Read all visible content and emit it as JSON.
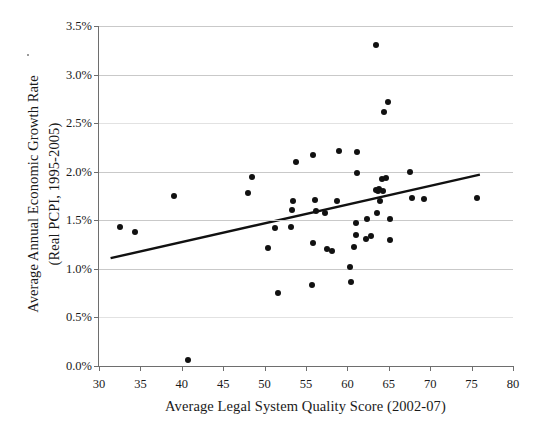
{
  "figure": {
    "top_artifact_text": "——   ·",
    "stray_mark": "·"
  },
  "chart_data": {
    "type": "scatter",
    "title": "",
    "xlabel": "Average Legal System Quality Score (2002-07)",
    "ylabel_line1": "Average Annual Economic Growth Rate",
    "ylabel_line2": "(Real PCPI, 1995-2005)",
    "xlim": [
      30,
      80
    ],
    "ylim": [
      0,
      3.5
    ],
    "xticks": [
      30,
      35,
      40,
      45,
      50,
      55,
      60,
      65,
      70,
      75,
      80
    ],
    "xtick_labels": [
      "30",
      "35",
      "40",
      "45",
      "50",
      "55",
      "60",
      "65",
      "70",
      "75",
      "80"
    ],
    "yticks": [
      0.0,
      0.5,
      1.0,
      1.5,
      2.0,
      2.5,
      3.0,
      3.5
    ],
    "ytick_labels": [
      "0.0%",
      "0.5%",
      "1.0%",
      "1.5%",
      "2.0%",
      "2.5%",
      "3.0%",
      "3.5%"
    ],
    "ytick_units": "percent",
    "grid": "horizontal",
    "legend": "none",
    "marker": "filled-circle",
    "marker_color": "#111111",
    "grid_color": "#c9c9c9",
    "axis_color": "#6e6e6e",
    "points": [
      {
        "x": 32.5,
        "y": 1.43
      },
      {
        "x": 34.3,
        "y": 1.38
      },
      {
        "x": 39.1,
        "y": 1.75
      },
      {
        "x": 40.8,
        "y": 0.06
      },
      {
        "x": 48.0,
        "y": 1.78
      },
      {
        "x": 48.5,
        "y": 1.95
      },
      {
        "x": 50.4,
        "y": 1.21
      },
      {
        "x": 51.3,
        "y": 1.42
      },
      {
        "x": 51.6,
        "y": 0.75
      },
      {
        "x": 53.2,
        "y": 1.43
      },
      {
        "x": 53.3,
        "y": 1.61
      },
      {
        "x": 53.4,
        "y": 1.7
      },
      {
        "x": 53.8,
        "y": 2.1
      },
      {
        "x": 55.7,
        "y": 0.83
      },
      {
        "x": 55.8,
        "y": 1.27
      },
      {
        "x": 55.9,
        "y": 2.17
      },
      {
        "x": 56.1,
        "y": 1.71
      },
      {
        "x": 56.2,
        "y": 1.6
      },
      {
        "x": 57.3,
        "y": 1.58
      },
      {
        "x": 57.5,
        "y": 1.2
      },
      {
        "x": 58.2,
        "y": 1.18
      },
      {
        "x": 58.8,
        "y": 1.7
      },
      {
        "x": 59.0,
        "y": 2.21
      },
      {
        "x": 60.3,
        "y": 1.02
      },
      {
        "x": 60.4,
        "y": 0.86
      },
      {
        "x": 60.8,
        "y": 1.22
      },
      {
        "x": 61.0,
        "y": 1.35
      },
      {
        "x": 61.0,
        "y": 1.47
      },
      {
        "x": 61.1,
        "y": 1.99
      },
      {
        "x": 61.2,
        "y": 2.2
      },
      {
        "x": 62.2,
        "y": 1.31
      },
      {
        "x": 62.4,
        "y": 1.51
      },
      {
        "x": 62.8,
        "y": 1.34
      },
      {
        "x": 63.4,
        "y": 3.3
      },
      {
        "x": 63.5,
        "y": 1.81
      },
      {
        "x": 63.7,
        "y": 1.8
      },
      {
        "x": 63.8,
        "y": 1.82
      },
      {
        "x": 63.6,
        "y": 1.58
      },
      {
        "x": 63.9,
        "y": 1.7
      },
      {
        "x": 64.2,
        "y": 1.92
      },
      {
        "x": 64.3,
        "y": 1.8
      },
      {
        "x": 64.4,
        "y": 2.61
      },
      {
        "x": 64.7,
        "y": 1.94
      },
      {
        "x": 64.9,
        "y": 2.72
      },
      {
        "x": 65.1,
        "y": 1.51
      },
      {
        "x": 65.2,
        "y": 1.3
      },
      {
        "x": 67.6,
        "y": 2.0
      },
      {
        "x": 67.8,
        "y": 1.73
      },
      {
        "x": 69.2,
        "y": 1.72
      },
      {
        "x": 75.6,
        "y": 1.73
      }
    ],
    "trendline": {
      "type": "linear-fit",
      "x_start": 31.4,
      "y_start": 1.11,
      "x_end": 76.0,
      "y_end": 1.97,
      "color": "#111111"
    }
  }
}
